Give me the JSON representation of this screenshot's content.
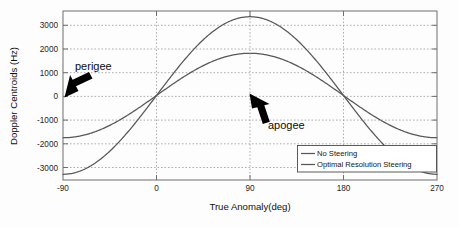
{
  "chart_data": {
    "type": "line",
    "title": "",
    "xlabel": "True Anomaly(deg)",
    "ylabel": "Doppler Centroids (Hz)",
    "xlim": [
      -90,
      270
    ],
    "ylim": [
      -3700,
      3700
    ],
    "xticks": [
      -90,
      0,
      90,
      180,
      270
    ],
    "xtick_labels": [
      "-90",
      "0",
      "90",
      "180",
      "270"
    ],
    "yticks": [
      -3000,
      -2000,
      -1000,
      0,
      1000,
      2000,
      3000
    ],
    "ytick_labels": [
      "-3000",
      "-2000",
      "-1000",
      "0",
      "1000",
      "2000",
      "3000"
    ],
    "grid": true,
    "legend_position": "lower right",
    "series": [
      {
        "name": "No Steering",
        "amplitude": 3450,
        "x": [
          -90,
          -75,
          -60,
          -45,
          -30,
          -15,
          0,
          15,
          30,
          45,
          60,
          75,
          90,
          105,
          120,
          135,
          150,
          165,
          180,
          195,
          210,
          225,
          240,
          255,
          270
        ],
        "values": [
          0,
          -893,
          -1725,
          -2440,
          -2988,
          -3332,
          -3450,
          -3332,
          -2988,
          -2440,
          -1725,
          -893,
          0,
          893,
          1725,
          2440,
          2988,
          3332,
          3450,
          3332,
          2988,
          2440,
          1725,
          893,
          0
        ]
      },
      {
        "name": "Optimal Resolution Steering",
        "amplitude": 1850,
        "x": [
          -90,
          -75,
          -60,
          -45,
          -30,
          -15,
          0,
          15,
          30,
          45,
          60,
          75,
          90,
          105,
          120,
          135,
          150,
          165,
          180,
          195,
          210,
          225,
          240,
          255,
          270
        ],
        "values": [
          0,
          -479,
          -925,
          -1308,
          -1602,
          -1787,
          -1850,
          -1787,
          -1602,
          -1308,
          -925,
          -479,
          0,
          479,
          925,
          1308,
          1602,
          1787,
          1850,
          1787,
          1602,
          1308,
          925,
          479,
          0
        ]
      }
    ],
    "annotations": [
      {
        "text": "perigee",
        "point_x": -90,
        "point_y": 0
      },
      {
        "text": "apogee",
        "point_x": 90,
        "point_y": 0
      }
    ]
  },
  "axes": {
    "y_title": "Doppler Centroids (Hz)",
    "x_title": "True Anomaly(deg)"
  },
  "legend": {
    "entries": [
      {
        "label": "No Steering"
      },
      {
        "label": "Optimal Resolution Steering"
      }
    ]
  },
  "annotations": {
    "perigee": "perigee",
    "apogee": "apogee"
  },
  "ticks": {
    "y": [
      "3000",
      "2000",
      "1000",
      "0",
      "-1000",
      "-2000",
      "-3000"
    ],
    "x": [
      "-90",
      "0",
      "90",
      "180",
      "270"
    ]
  },
  "colors": {
    "curve": "#575757",
    "axis": "#6f6f6f",
    "grid": "#9a9a9a",
    "text": "#121212",
    "background": "#fdfdfd",
    "arrow": "#000000"
  }
}
